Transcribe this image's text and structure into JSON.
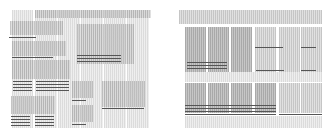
{
  "illustration": {
    "description": "Two abstract wireframe grid layouts composed of striped gray blocks and dark text-like lines",
    "colors": {
      "block": "#b4b4b4",
      "block_light": "#d6d6d6",
      "line": "#555555",
      "background": "#ffffff"
    },
    "left_panel": {
      "label": ""
    },
    "right_panel": {
      "label": ""
    }
  }
}
